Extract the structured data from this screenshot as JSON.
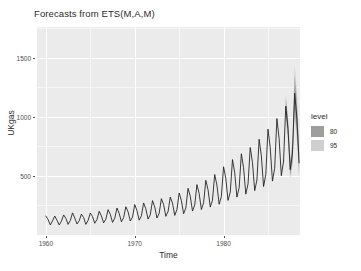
{
  "chart_data": {
    "type": "line",
    "title": "Forecasts from ETS(M,A,M)",
    "xlabel": "Time",
    "ylabel": "UKgas",
    "xlim": [
      1959.0,
      1988.6
    ],
    "ylim": [
      0,
      1760
    ],
    "grid": true,
    "x_ticks": [
      1960,
      1970,
      1980
    ],
    "x_tick_labels": [
      "1960",
      "1970",
      "1980"
    ],
    "y_ticks": [
      500,
      1000,
      1500
    ],
    "y_tick_labels": [
      "500",
      "1000",
      "1500"
    ],
    "legend": {
      "title": "level",
      "position": "right",
      "entries": [
        {
          "label": "80",
          "color": "#9e9e9e"
        },
        {
          "label": "95",
          "color": "#cfcfcf"
        }
      ]
    },
    "series": [
      {
        "name": "UKgas quarterly consumption",
        "type": "line",
        "color": "#1a1a1a",
        "x": [
          1960.0,
          1960.25,
          1960.5,
          1960.75,
          1961.0,
          1961.25,
          1961.5,
          1961.75,
          1962.0,
          1962.25,
          1962.5,
          1962.75,
          1963.0,
          1963.25,
          1963.5,
          1963.75,
          1964.0,
          1964.25,
          1964.5,
          1964.75,
          1965.0,
          1965.25,
          1965.5,
          1965.75,
          1966.0,
          1966.25,
          1966.5,
          1966.75,
          1967.0,
          1967.25,
          1967.5,
          1967.75,
          1968.0,
          1968.25,
          1968.5,
          1968.75,
          1969.0,
          1969.25,
          1969.5,
          1969.75,
          1970.0,
          1970.25,
          1970.5,
          1970.75,
          1971.0,
          1971.25,
          1971.5,
          1971.75,
          1972.0,
          1972.25,
          1972.5,
          1972.75,
          1973.0,
          1973.25,
          1973.5,
          1973.75,
          1974.0,
          1974.25,
          1974.5,
          1974.75,
          1975.0,
          1975.25,
          1975.5,
          1975.75,
          1976.0,
          1976.25,
          1976.5,
          1976.75,
          1977.0,
          1977.25,
          1977.5,
          1977.75,
          1978.0,
          1978.25,
          1978.5,
          1978.75,
          1979.0,
          1979.25,
          1979.5,
          1979.75,
          1980.0,
          1980.25,
          1980.5,
          1980.75,
          1981.0,
          1981.25,
          1981.5,
          1981.75,
          1982.0,
          1982.25,
          1982.5,
          1982.75,
          1983.0,
          1983.25,
          1983.5,
          1983.75,
          1984.0,
          1984.25,
          1984.5,
          1984.75,
          1985.0,
          1985.25,
          1985.5,
          1985.75,
          1986.0,
          1986.25,
          1986.5,
          1986.75
        ],
        "y": [
          160.1,
          129.7,
          84.8,
          120.1,
          160.1,
          124.9,
          84.8,
          116.9,
          169.7,
          140.9,
          89.7,
          123.3,
          187.2,
          144.1,
          92.9,
          120.1,
          176.1,
          147.3,
          89.7,
          123.3,
          185.9,
          155.8,
          99.3,
          131.3,
          200.6,
          161.0,
          102.5,
          134.5,
          214.3,
          174.7,
          106.5,
          142.5,
          228.0,
          182.0,
          111.7,
          147.3,
          238.8,
          196.0,
          118.1,
          152.1,
          257.5,
          207.1,
          125.3,
          162.5,
          271.3,
          221.8,
          134.5,
          171.3,
          291.0,
          238.1,
          143.3,
          183.3,
          307.4,
          256.5,
          157.7,
          198.2,
          320.6,
          270.1,
          165.7,
          215.6,
          355.0,
          292.6,
          180.0,
          229.2,
          394.8,
          328.5,
          202.5,
          254.1,
          426.1,
          350.9,
          215.6,
          272.9,
          462.8,
          383.4,
          236.4,
          295.0,
          512.0,
          422.5,
          260.1,
          325.4,
          577.3,
          479.0,
          292.8,
          362.8,
          638.1,
          527.8,
          320.9,
          399.6,
          687.5,
          568.5,
          345.8,
          432.3,
          740.0,
          614.2,
          375.0,
          465.0,
          810.0,
          670.0,
          410.0,
          512.0,
          895.0,
          740.0,
          456.0,
          565.0,
          985.0,
          815.0,
          502.0,
          625.0
        ]
      },
      {
        "name": "Point forecast (ETS(M,A,M))",
        "type": "line",
        "color": "#1a1a1a",
        "x": [
          1987.0,
          1987.25,
          1987.5,
          1987.75,
          1988.0,
          1988.25,
          1988.5
        ],
        "y": [
          1090.0,
          900.0,
          553.0,
          690.0,
          1200.0,
          990.0,
          608.0
        ]
      }
    ],
    "intervals": [
      {
        "level": 80,
        "color": "#9e9e9e",
        "x": [
          1987.0,
          1987.25,
          1987.5,
          1987.75,
          1988.0,
          1988.25,
          1988.5
        ],
        "lower": [
          1020,
          830,
          500,
          615,
          1060,
          860,
          520
        ],
        "upper": [
          1160,
          975,
          610,
          768,
          1345,
          1125,
          700
        ]
      },
      {
        "level": 95,
        "color": "#cfcfcf",
        "x": [
          1987.0,
          1987.25,
          1987.5,
          1987.75,
          1988.0,
          1988.25,
          1988.5
        ],
        "lower": [
          985,
          795,
          475,
          580,
          985,
          790,
          475
        ],
        "upper": [
          1200,
          1015,
          640,
          805,
          1440,
          1210,
          755
        ]
      }
    ]
  },
  "legend": {
    "title": "level",
    "entry_80": "80",
    "entry_95": "95"
  },
  "axes": {
    "x_title": "Time",
    "y_title": "UKgas"
  },
  "title": "Forecasts from ETS(M,A,M)",
  "colors": {
    "panel_background": "#ebebeb",
    "grid_major": "#ffffff",
    "grid_minor": "#f6f6f6",
    "series_line": "#1a1a1a",
    "level_80": "#9e9e9e",
    "level_95": "#cfcfcf",
    "text": "#2b2b2b",
    "axis_text": "#4d4d4d"
  }
}
